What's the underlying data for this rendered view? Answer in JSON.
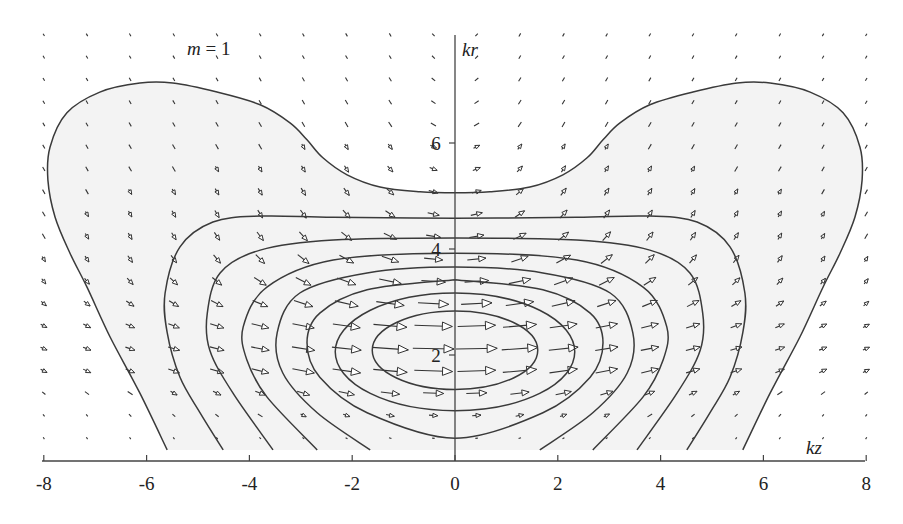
{
  "chart_data": {
    "type": "vector_field_contour",
    "title": "",
    "annotation": {
      "variable": "m",
      "equals": " = ",
      "value": "1"
    },
    "xlabel": "kz",
    "ylabel": "kr",
    "xlim": [
      -8,
      8
    ],
    "ylim": [
      0,
      8
    ],
    "x_ticks": [
      -8,
      -6,
      -4,
      -2,
      0,
      2,
      4,
      6,
      8
    ],
    "x_tick_labels": [
      "-8",
      "-6",
      "-4",
      "-2",
      "0",
      "2",
      "4",
      "6",
      "8"
    ],
    "y_ticks": [
      2,
      4,
      6
    ],
    "y_tick_labels": [
      "2",
      "4",
      "6"
    ],
    "grid": false,
    "symmetry": "mirror about kz = 0 (contours symmetric; vector kr-component antisymmetric)",
    "contours": [
      {
        "level": 1,
        "closed": false,
        "half_points": [
          [
            -5.6,
            0.21
          ],
          [
            -6.13,
            1.28
          ],
          [
            -6.71,
            2.34
          ],
          [
            -7.16,
            3.28
          ],
          [
            -7.49,
            3.92
          ],
          [
            -7.78,
            4.6
          ],
          [
            -7.92,
            5.3
          ],
          [
            -7.88,
            5.92
          ],
          [
            -7.55,
            6.57
          ],
          [
            -6.91,
            6.96
          ],
          [
            -6.13,
            7.13
          ],
          [
            -5.49,
            7.13
          ],
          [
            -4.63,
            6.96
          ],
          [
            -3.79,
            6.72
          ],
          [
            -3.21,
            6.38
          ],
          [
            -2.88,
            6.06
          ],
          [
            -2.57,
            5.72
          ],
          [
            -2.1,
            5.4
          ],
          [
            -1.46,
            5.17
          ],
          [
            -0.68,
            5.08
          ],
          [
            0,
            5.06
          ]
        ]
      },
      {
        "level": 2,
        "closed": false,
        "half_points": [
          [
            -4.51,
            0.21
          ],
          [
            -4.96,
            0.91
          ],
          [
            -5.35,
            1.58
          ],
          [
            -5.6,
            2.42
          ],
          [
            -5.64,
            3.17
          ],
          [
            -5.35,
            4.04
          ],
          [
            -4.71,
            4.51
          ],
          [
            -3.79,
            4.62
          ],
          [
            -2.37,
            4.6
          ],
          [
            0,
            4.58
          ]
        ]
      },
      {
        "level": 3,
        "closed": false,
        "half_points": [
          [
            -3.54,
            0.21
          ],
          [
            -4.32,
            1.28
          ],
          [
            -4.77,
            2.09
          ],
          [
            -4.82,
            2.79
          ],
          [
            -4.57,
            3.55
          ],
          [
            -3.79,
            3.98
          ],
          [
            -2.37,
            4.17
          ],
          [
            0,
            4.21
          ]
        ]
      },
      {
        "level": 4,
        "closed": false,
        "half_points": [
          [
            -2.68,
            0.21
          ],
          [
            -3.66,
            1.21
          ],
          [
            -4.05,
            1.91
          ],
          [
            -4.12,
            2.53
          ],
          [
            -3.66,
            3.28
          ],
          [
            -2.37,
            3.79
          ],
          [
            0,
            3.92
          ]
        ]
      },
      {
        "level": 5,
        "closed": false,
        "half_points": [
          [
            -1.65,
            0.21
          ],
          [
            -2.68,
            0.91
          ],
          [
            -3.35,
            1.66
          ],
          [
            -3.46,
            2.42
          ],
          [
            -3.02,
            3.17
          ],
          [
            -1.71,
            3.55
          ],
          [
            0,
            3.66
          ]
        ]
      },
      {
        "level": 6,
        "closed": true,
        "half_points": [
          [
            0,
            3.42
          ],
          [
            -1.71,
            3.23
          ],
          [
            -2.63,
            2.79
          ],
          [
            -2.88,
            2.23
          ],
          [
            -2.63,
            1.58
          ],
          [
            -1.71,
            0.91
          ],
          [
            0,
            0.43
          ]
        ]
      },
      {
        "level": 7,
        "closed": true,
        "ellipse": {
          "center": [
            0,
            2.06
          ],
          "semi_kz": 2.33,
          "semi_kr": 1.11
        }
      },
      {
        "level": 8,
        "closed": true,
        "ellipse": {
          "center": [
            0,
            2.09
          ],
          "semi_kz": 1.61,
          "semi_kr": 0.74
        }
      }
    ],
    "vector_field": {
      "kz_positive": [
        0.42,
        1.26,
        2.11,
        2.95,
        3.79,
        4.63,
        5.47,
        6.32,
        7.16,
        8.0
      ],
      "kr": [
        8.04,
        7.62,
        7.2,
        6.77,
        6.35,
        5.93,
        5.51,
        5.08,
        4.66,
        4.24,
        3.81,
        3.39,
        2.97,
        2.55,
        2.12,
        1.7,
        1.28,
        0.86,
        0.43
      ],
      "magnitude_relative": [
        [
          0.085,
          0.084,
          0.083,
          0.081,
          0.079,
          0.077,
          0.074,
          0.072,
          0.069,
          0.066
        ],
        [
          0.095,
          0.094,
          0.093,
          0.091,
          0.088,
          0.085,
          0.082,
          0.078,
          0.075,
          0.071
        ],
        [
          0.107,
          0.106,
          0.104,
          0.101,
          0.098,
          0.094,
          0.09,
          0.086,
          0.082,
          0.077
        ],
        [
          0.122,
          0.12,
          0.118,
          0.115,
          0.11,
          0.105,
          0.1,
          0.095,
          0.089,
          0.084
        ],
        [
          0.14,
          0.138,
          0.135,
          0.13,
          0.125,
          0.118,
          0.112,
          0.105,
          0.098,
          0.092
        ],
        [
          0.162,
          0.16,
          0.155,
          0.149,
          0.142,
          0.133,
          0.125,
          0.116,
          0.108,
          0.1
        ],
        [
          0.191,
          0.188,
          0.181,
          0.173,
          0.162,
          0.151,
          0.14,
          0.129,
          0.118,
          0.109
        ],
        [
          0.23,
          0.225,
          0.215,
          0.202,
          0.188,
          0.173,
          0.157,
          0.143,
          0.13,
          0.118
        ],
        [
          0.281,
          0.273,
          0.257,
          0.239,
          0.218,
          0.197,
          0.177,
          0.159,
          0.143,
          0.128
        ],
        [
          0.349,
          0.336,
          0.313,
          0.284,
          0.254,
          0.225,
          0.199,
          0.175,
          0.155,
          0.138
        ],
        [
          0.445,
          0.423,
          0.385,
          0.341,
          0.297,
          0.257,
          0.222,
          0.193,
          0.168,
          0.148
        ],
        [
          0.572,
          0.534,
          0.473,
          0.405,
          0.342,
          0.289,
          0.245,
          0.209,
          0.18,
          0.157
        ],
        [
          0.735,
          0.67,
          0.57,
          0.471,
          0.387,
          0.319,
          0.265,
          0.223,
          0.19,
          0.164
        ],
        [
          0.9,
          0.8,
          0.657,
          0.526,
          0.421,
          0.34,
          0.279,
          0.232,
          0.196,
          0.168
        ],
        [
          0.98,
          0.86,
          0.7,
          0.55,
          0.435,
          0.349,
          0.284,
          0.236,
          0.199,
          0.17
        ],
        [
          0.91,
          0.81,
          0.67,
          0.53,
          0.42,
          0.34,
          0.28,
          0.23,
          0.2,
          0.17
        ],
        [
          0.49,
          0.45,
          0.38,
          0.31,
          0.25,
          0.21,
          0.18,
          0.14,
          0.12,
          0.1
        ],
        [
          0.21,
          0.2,
          0.17,
          0.15,
          0.13,
          0.1,
          0.09,
          0.08,
          0.06,
          0.06
        ],
        [
          0.06,
          0.06,
          0.05,
          0.05,
          0.04,
          0.03,
          0.03,
          0.02,
          0.02,
          0.02
        ]
      ],
      "angle_deg_positive_kz": [
        [
          47,
          60,
          60,
          60,
          60,
          60,
          60,
          60,
          60,
          60
        ],
        [
          44,
          60,
          60,
          60,
          60,
          60,
          60,
          60,
          60,
          60
        ],
        [
          39,
          59,
          60,
          60,
          60,
          60,
          60,
          60,
          60,
          60
        ],
        [
          35,
          58,
          60,
          60,
          60,
          60,
          60,
          60,
          60,
          60
        ],
        [
          30,
          56,
          60,
          60,
          60,
          60,
          60,
          60,
          60,
          60
        ],
        [
          25,
          53,
          59,
          60,
          60,
          60,
          60,
          60,
          60,
          60
        ],
        [
          21,
          48,
          57,
          59,
          60,
          60,
          60,
          60,
          60,
          60
        ],
        [
          16,
          41,
          53,
          58,
          59,
          60,
          60,
          60,
          60,
          60
        ],
        [
          13,
          34,
          48,
          54,
          58,
          59,
          60,
          60,
          60,
          60
        ],
        [
          9,
          26,
          39,
          48,
          53,
          56,
          58,
          59,
          59,
          60
        ],
        [
          6,
          19,
          29,
          38,
          45,
          50,
          53,
          55,
          57,
          58
        ],
        [
          4,
          12,
          20,
          27,
          33,
          39,
          43,
          47,
          50,
          52
        ],
        [
          3,
          8,
          13,
          18,
          22,
          27,
          31,
          34,
          38,
          41
        ],
        [
          2,
          5,
          8,
          11,
          14,
          17,
          20,
          23,
          26,
          28
        ],
        [
          1,
          4,
          6,
          9,
          11,
          14,
          16,
          18,
          21,
          23
        ],
        [
          2,
          5,
          8,
          11,
          14,
          16,
          19,
          22,
          25,
          27
        ],
        [
          2,
          7,
          12,
          17,
          21,
          25,
          29,
          33,
          36,
          39
        ],
        [
          4,
          12,
          19,
          26,
          32,
          38,
          42,
          46,
          49,
          51
        ],
        [
          6,
          18,
          29,
          37,
          44,
          49,
          52,
          55,
          56,
          58
        ]
      ]
    }
  }
}
